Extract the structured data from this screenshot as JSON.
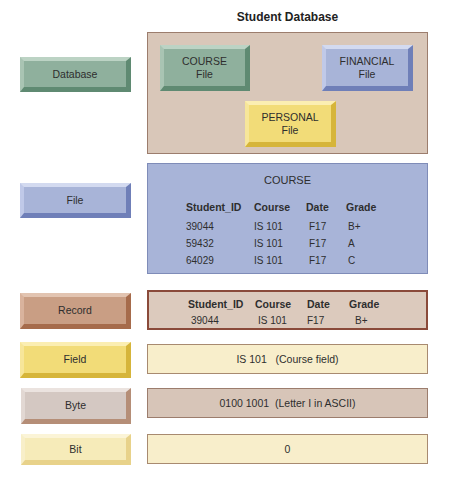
{
  "title": "Student Database",
  "levels": {
    "database": {
      "label": "Database",
      "color": "#8fb09d"
    },
    "file": {
      "label": "File",
      "color": "#a8b4d8"
    },
    "record": {
      "label": "Record",
      "color": "#c99e84"
    },
    "field": {
      "label": "Field",
      "color": "#f2dc78"
    },
    "byte": {
      "label": "Byte",
      "color": "#d4c8c2"
    },
    "bit": {
      "label": "Bit",
      "color": "#f6ebb9"
    }
  },
  "database_panel": {
    "files": [
      {
        "name": "COURSE",
        "suffix": "File",
        "color": "#8fb09d"
      },
      {
        "name": "FINANCIAL",
        "suffix": "File",
        "color": "#a8b4d8"
      },
      {
        "name": "PERSONAL",
        "suffix": "File",
        "color": "#f2dc78"
      }
    ]
  },
  "file_panel": {
    "title": "COURSE",
    "columns": [
      "Student_ID",
      "Course",
      "Date",
      "Grade"
    ],
    "rows": [
      [
        "39044",
        "IS 101",
        "F17",
        "B+"
      ],
      [
        "59432",
        "IS 101",
        "F17",
        "A"
      ],
      [
        "64029",
        "IS 101",
        "F17",
        "C"
      ]
    ]
  },
  "record_panel": {
    "columns": [
      "Student_ID",
      "Course",
      "Date",
      "Grade"
    ],
    "row": [
      "39044",
      "IS 101",
      "F17",
      "B+"
    ]
  },
  "field_panel": {
    "text": "IS 101   (Course field)"
  },
  "byte_panel": {
    "text": "0100 1001  (Letter I in ASCII)"
  },
  "bit_panel": {
    "text": "0"
  }
}
